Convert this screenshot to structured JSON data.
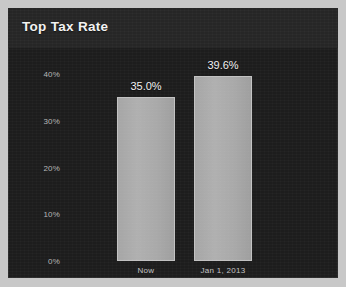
{
  "panel": {
    "background_color": "#1d1d1d",
    "title_band_color": "#262626",
    "outer_margin_color": "#c8c8c8"
  },
  "chart_data": {
    "type": "bar",
    "title": "Top Tax Rate",
    "xlabel": "",
    "ylabel": "",
    "categories": [
      "Now",
      "Jan 1, 2013"
    ],
    "values": [
      35.0,
      39.6
    ],
    "data_labels": [
      "35.0%",
      "39.6%"
    ],
    "ylim": [
      0,
      42.8
    ],
    "yticks": [
      0,
      10,
      20,
      30,
      40
    ],
    "ytick_labels": [
      "0%",
      "10%",
      "20%",
      "30%",
      "40%"
    ],
    "grid": false,
    "legend": null,
    "bar_color": "#a9a9a9",
    "bar_border_color": "#c2c2c2",
    "text_color": "#f0f0f0",
    "tick_color": "#b7b7b7"
  }
}
